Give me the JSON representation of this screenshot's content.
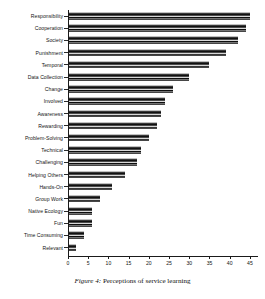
{
  "caption": {
    "number": "Figure 4:",
    "text": "Perceptions of service learning"
  },
  "chart_data": {
    "type": "bar",
    "orientation": "horizontal",
    "title": "",
    "xlabel": "",
    "ylabel": "",
    "xlim": [
      0,
      47
    ],
    "xticks": [
      0,
      5,
      10,
      15,
      20,
      25,
      30,
      35,
      40,
      45
    ],
    "xtick_labels": [
      "0",
      "5",
      "10",
      "15",
      "20",
      "25",
      "30",
      "35",
      "40",
      "45"
    ],
    "grid": false,
    "legend": false,
    "categories": [
      "Responsibility",
      "Cooperation",
      "Society",
      "Punishment",
      "Temporal",
      "Data Collection",
      "Change",
      "Involved",
      "Awareness",
      "Rewarding",
      "Problem-Solving",
      "Technical",
      "Challenging",
      "Helping Others",
      "Hands-On",
      "Group Work",
      "Native Ecology",
      "Fun",
      "Time Consuming",
      "Relevant"
    ],
    "values": [
      45,
      44,
      42,
      39,
      35,
      30,
      26,
      24,
      23,
      22,
      20,
      18,
      17,
      14,
      11,
      8,
      6,
      6,
      4,
      2
    ],
    "bars": [
      {
        "label": "Responsibility",
        "value": 45
      },
      {
        "label": "Cooperation",
        "value": 44
      },
      {
        "label": "Society",
        "value": 42
      },
      {
        "label": "Punishment",
        "value": 39
      },
      {
        "label": "Temporal",
        "value": 35
      },
      {
        "label": "Data Collection",
        "value": 30
      },
      {
        "label": "Change",
        "value": 26
      },
      {
        "label": "Involved",
        "value": 24
      },
      {
        "label": "Awareness",
        "value": 23
      },
      {
        "label": "Rewarding",
        "value": 22
      },
      {
        "label": "Problem-Solving",
        "value": 20
      },
      {
        "label": "Technical",
        "value": 18
      },
      {
        "label": "Challenging",
        "value": 17
      },
      {
        "label": "Helping Others",
        "value": 14
      },
      {
        "label": "Hands-On",
        "value": 11
      },
      {
        "label": "Group Work",
        "value": 8
      },
      {
        "label": "Native Ecology",
        "value": 6
      },
      {
        "label": "Fun",
        "value": 6
      },
      {
        "label": "Time Consuming",
        "value": 4
      },
      {
        "label": "Relevant",
        "value": 2
      }
    ],
    "colors": {
      "bar_fill": "#2b2b2b",
      "bar_edge": "#0a0a0a",
      "axis": "#1a1a1a",
      "background": "#ffffff",
      "text": "#141414"
    }
  }
}
